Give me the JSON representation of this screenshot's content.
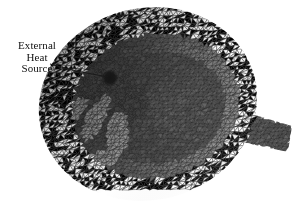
{
  "figure": {
    "kind": "finite-element-mesh-render",
    "background_color": "#ffffff",
    "width": 297,
    "height": 215
  },
  "annotation": {
    "name": "external-heat-source-callout",
    "line1": "External",
    "line2": "Heat",
    "line3": "Source",
    "text_color": "#111111",
    "leader": {
      "color": "#1a1a1a",
      "start_x": 50,
      "start_y": 64,
      "bend_x": 76,
      "bend_y": 71,
      "end_x": 108,
      "end_y": 77
    }
  },
  "heat_source_marker": {
    "name": "heat-source-spot",
    "center_x": 110,
    "center_y": 78,
    "radius": 4.6,
    "color": "#151515"
  },
  "mesh": {
    "element_type": "triangle",
    "edge_color": "#2a2a2a",
    "palette": {
      "rim_dark": "#1d1d1d",
      "shell_dark": "#3b3b3b",
      "shell_mid": "#5a5a5a",
      "shell_light": "#8d8d8d",
      "shell_highlight": "#a8a8a8",
      "cavity_mid": "#585858",
      "cavity_dark": "#343434",
      "blade_light": "#9a9a9a",
      "flange": "#6a6a6a"
    },
    "regions": [
      {
        "name": "outer-shell-ellipse",
        "shape": "ellipse",
        "cx": 148,
        "cy": 104,
        "rx": 110,
        "ry": 96,
        "rotation_deg": -14,
        "fill": "#5f5f5f"
      },
      {
        "name": "upper-rim-shadow",
        "shape": "ellipse-band",
        "fill": "#1f1f1f"
      },
      {
        "name": "inner-cavity-ellipse",
        "shape": "ellipse",
        "cx": 156,
        "cy": 106,
        "rx": 84,
        "ry": 72,
        "rotation_deg": -14,
        "fill": "#4e4e4e"
      },
      {
        "name": "cavity-floor-ellipse",
        "shape": "ellipse",
        "cx": 160,
        "cy": 108,
        "rx": 66,
        "ry": 55,
        "rotation_deg": -14,
        "fill": "#4a4a4a"
      },
      {
        "name": "outlet-flange",
        "shape": "quad",
        "fill": "#6a6a6a"
      }
    ],
    "blades": [
      {
        "name": "blade-1",
        "cx": 96,
        "cy": 118,
        "rx": 9,
        "ry": 26,
        "rotation_deg": 28
      },
      {
        "name": "blade-2",
        "cx": 118,
        "cy": 135,
        "rx": 11,
        "ry": 24,
        "rotation_deg": 8
      },
      {
        "name": "blade-3",
        "cx": 101,
        "cy": 160,
        "rx": 22,
        "ry": 9,
        "rotation_deg": -22
      },
      {
        "name": "blade-4",
        "cx": 74,
        "cy": 112,
        "rx": 8,
        "ry": 18,
        "rotation_deg": 40
      }
    ]
  }
}
